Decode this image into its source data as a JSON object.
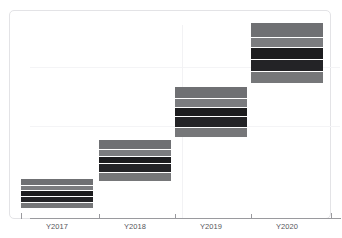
{
  "chart_data": {
    "type": "bar",
    "title": "",
    "subtitle": "",
    "xlabel": "",
    "ylabel": "",
    "categories": [
      "Y2017",
      "Y2018",
      "Y2019",
      "Y2020"
    ],
    "values": [
      1,
      2,
      3,
      4
    ],
    "grid": true,
    "legend": false,
    "legend_position": "none",
    "ylim": [
      0,
      4.5
    ],
    "note": "Waterfall-style ascending staircase; each bar is a floating block of 5 stacked horizontal bands",
    "series": [
      {
        "name": "band-1",
        "values": [
          1,
          1,
          1,
          1
        ]
      },
      {
        "name": "band-2",
        "values": [
          1,
          1,
          1,
          1
        ]
      },
      {
        "name": "band-3",
        "values": [
          1,
          1,
          1,
          1
        ]
      },
      {
        "name": "band-4",
        "values": [
          1,
          1,
          1,
          1
        ]
      },
      {
        "name": "band-5",
        "values": [
          1,
          1,
          1,
          1
        ]
      }
    ],
    "bars": [
      {
        "category": "Y2017",
        "x": 20,
        "width": 72,
        "top": 178,
        "bottom": 207,
        "bands": [
          {
            "name": "band-1",
            "color": "#6f7073",
            "height": 7
          },
          {
            "name": "band-2",
            "color": "#7b7c7f",
            "height": 4
          },
          {
            "name": "band-3",
            "color": "#1c1c1e",
            "height": 5
          },
          {
            "name": "band-4",
            "color": "#232326",
            "height": 6
          },
          {
            "name": "band-5",
            "color": "#767779",
            "height": 5
          }
        ]
      },
      {
        "category": "Y2018",
        "x": 98,
        "width": 72,
        "top": 139,
        "bottom": 180,
        "bands": [
          {
            "name": "band-1",
            "color": "#6f7073",
            "height": 9
          },
          {
            "name": "band-2",
            "color": "#7b7c7f",
            "height": 6
          },
          {
            "name": "band-3",
            "color": "#1c1c1e",
            "height": 7
          },
          {
            "name": "band-4",
            "color": "#232326",
            "height": 8
          },
          {
            "name": "band-5",
            "color": "#767779",
            "height": 8
          }
        ]
      },
      {
        "category": "Y2019",
        "x": 174,
        "width": 72,
        "top": 86,
        "bottom": 136,
        "bands": [
          {
            "name": "band-1",
            "color": "#6f7073",
            "height": 11
          },
          {
            "name": "band-2",
            "color": "#7b7c7f",
            "height": 8
          },
          {
            "name": "band-3",
            "color": "#1c1c1e",
            "height": 9
          },
          {
            "name": "band-4",
            "color": "#232326",
            "height": 10
          },
          {
            "name": "band-5",
            "color": "#767779",
            "height": 9
          }
        ]
      },
      {
        "category": "Y2020",
        "x": 250,
        "width": 72,
        "top": 22,
        "bottom": 82,
        "bands": [
          {
            "name": "band-1",
            "color": "#6f7073",
            "height": 14
          },
          {
            "name": "band-2",
            "color": "#7b7c7f",
            "height": 10
          },
          {
            "name": "band-3",
            "color": "#1c1c1e",
            "height": 11
          },
          {
            "name": "band-4",
            "color": "#232326",
            "height": 12
          },
          {
            "name": "band-5",
            "color": "#767779",
            "height": 11
          }
        ]
      }
    ],
    "gridlines_h": [
      56,
      115
    ],
    "gridlines_v": [
      172
    ],
    "ticks_x": [
      20,
      98,
      174,
      250,
      330
    ],
    "colors": {
      "band_gray_light": "#7b7c7f",
      "band_gray": "#6f7073",
      "band_gray_mid": "#767779",
      "band_dark": "#1c1c1e",
      "band_dark_alt": "#232326",
      "axis": "#9a9a9e",
      "grid": "#f4f4f6",
      "frame_border": "#e3e3e6",
      "background": "#ffffff",
      "tick_label": "#55565a"
    }
  }
}
